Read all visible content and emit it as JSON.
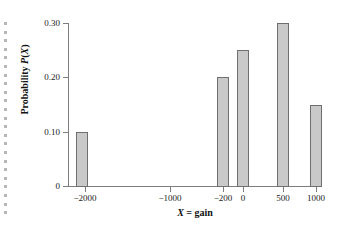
{
  "chart_data": {
    "type": "bar",
    "title": "",
    "subtitle": "",
    "xlabel": "X = gain",
    "ylabel": "Probability P(X)",
    "categories": [
      "-2000",
      "-200",
      "0",
      "500",
      "1000"
    ],
    "values": [
      0.1,
      0.2,
      0.25,
      0.3,
      0.15
    ],
    "series": [
      {
        "name": "Probability P(X)",
        "values": [
          0.1,
          0.2,
          0.25,
          0.3,
          0.15
        ]
      }
    ],
    "ylim": [
      0,
      0.3
    ],
    "y_ticks": [
      "0",
      "0.10",
      "0.20",
      "0.30"
    ],
    "y_tick_values": [
      0,
      0.1,
      0.2,
      0.3
    ],
    "x_ticks": [
      "-2000",
      "-1000",
      "-200",
      "0",
      "500",
      "1000"
    ],
    "x_tick_values": [
      -2000,
      -1000,
      -200,
      0,
      500,
      1000
    ],
    "grid": false,
    "legend": "none",
    "bar_fill_color": "#c9c9c9",
    "bar_border_color": "#6f6f6f",
    "axis_color": "#7d7d7d",
    "background_color": "#ffffff",
    "note": "Discrete probability distribution; bars drawn only at values with nonzero probability (no bar at -1000)."
  },
  "axes": {
    "y_title_parts": {
      "prefix": "Probability ",
      "p_symbol": "P",
      "open_paren": "(",
      "x_symbol": "X",
      "close_paren": ")"
    },
    "x_title_parts": {
      "x_symbol": "X",
      "equation": " = gain"
    }
  },
  "y_axis_ticks": [
    {
      "label": "0.30",
      "value": 0.3,
      "top": 19,
      "tick_top": 23
    },
    {
      "label": "0.20",
      "value": 0.2,
      "top": 73,
      "tick_top": 77
    },
    {
      "label": "0.10",
      "value": 0.1,
      "top": 128,
      "tick_top": 132
    },
    {
      "label": "0",
      "value": 0,
      "top": 182,
      "tick_top": 186
    }
  ],
  "x_axis_ticks": [
    {
      "label": "-2000",
      "value": -2000,
      "left": 85
    },
    {
      "label": "-1000",
      "value": -1000,
      "left": 170
    },
    {
      "label": "-200",
      "value": -200,
      "left": 223
    },
    {
      "label": "0",
      "value": 0,
      "left": 243
    },
    {
      "label": "500",
      "value": 500,
      "left": 283
    },
    {
      "label": "1000",
      "value": 1000,
      "left": 316
    }
  ],
  "bars": [
    {
      "name": "bar-neg2000",
      "category": "-2000",
      "value": 0.1,
      "left": 76,
      "width": 12,
      "top": 132,
      "height": 55
    },
    {
      "name": "bar-neg200",
      "category": "-200",
      "value": 0.2,
      "left": 217,
      "width": 12,
      "top": 77,
      "height": 110
    },
    {
      "name": "bar-0",
      "category": "0",
      "value": 0.25,
      "left": 237,
      "width": 12,
      "top": 50,
      "height": 137
    },
    {
      "name": "bar-500",
      "category": "500",
      "value": 0.3,
      "left": 277,
      "width": 12,
      "top": 23,
      "height": 164
    },
    {
      "name": "bar-1000",
      "category": "1000",
      "value": 0.15,
      "left": 310,
      "width": 12,
      "top": 105,
      "height": 82
    }
  ],
  "edge_dots": {
    "count": 23,
    "start_top": 22,
    "spacing": 8.6,
    "color": "#b6b6b6"
  }
}
